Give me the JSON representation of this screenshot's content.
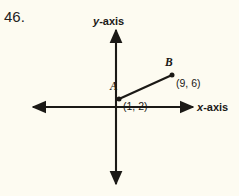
{
  "figure": {
    "problem_number": "46.",
    "background_color": "#fdfbf1",
    "ink_color": "#1b1916"
  },
  "axes": {
    "y_label_var": "y",
    "y_label_rest": "-axis",
    "x_label_var": "x",
    "x_label_rest": "-axis",
    "origin": {
      "x": 116,
      "y": 107
    },
    "x_axis": {
      "left_end": 30,
      "right_end": 195,
      "y": 107
    },
    "y_axis": {
      "top_end": 26,
      "bottom_end": 188,
      "x": 116
    }
  },
  "points": [
    {
      "name": "A",
      "label": "A",
      "coordinates_text": "(1, 2)",
      "coordinates": [
        1,
        2
      ],
      "pixel": {
        "x": 119,
        "y": 99
      }
    },
    {
      "name": "B",
      "label": "B",
      "coordinates_text": "(9, 6)",
      "coordinates": [
        9,
        6
      ],
      "pixel": {
        "x": 172,
        "y": 75
      }
    }
  ],
  "segment": {
    "name": "segment-AB",
    "from": "A",
    "to": "B"
  }
}
